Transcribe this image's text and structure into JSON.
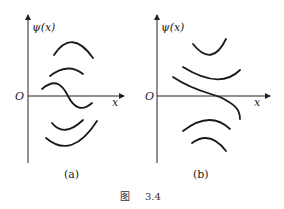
{
  "figure": {
    "caption_prefix": "图",
    "caption_number": "3.4",
    "panels": [
      {
        "id": "a",
        "label": "(a)",
        "y_axis_label": "ψ(x)",
        "x_axis_label": "x",
        "origin_label": "O",
        "curves": [
          "concave-down arc above axis",
          "concave-down arc above axis",
          "oscillating crossing curve through axis",
          "concave-up arc below axis",
          "concave-up arc below axis"
        ]
      },
      {
        "id": "b",
        "label": "(b)",
        "y_axis_label": "ψ(x)",
        "x_axis_label": "x",
        "origin_label": "O",
        "curves": [
          "concave-up arc above axis",
          "concave-up arc above axis",
          "decreasing curve crossing axis",
          "concave-down arc below axis",
          "concave-down arc below axis"
        ]
      }
    ]
  }
}
